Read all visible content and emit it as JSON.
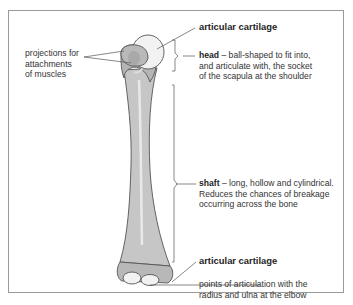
{
  "diagram": {
    "labels": {
      "projections": "projections for attachments of muscles",
      "projections_lines": [
        "projections for",
        "attachments",
        "of muscles"
      ],
      "top_cartilage": "articular cartilage",
      "head_term": "head",
      "head_desc_lines": [
        " – ball-shaped to fit into,",
        "and articulate with, the socket",
        "of the scapula at the shoulder"
      ],
      "shaft_term": "shaft",
      "shaft_desc_lines": [
        " – long, hollow and cylindrical.",
        "Reduces the chances of breakage",
        "occurring across the bone"
      ],
      "bottom_cartilage": "articular cartilage",
      "articulation_lines": [
        "points of articulation with the",
        "radius and ulna at the elbow"
      ]
    },
    "colors": {
      "bone_fill": "#c8c8c8",
      "bone_shade": "#a9a9a9",
      "cartilage": "#f2f2f2",
      "outline": "#555555",
      "frame": "#9a9a9a"
    }
  }
}
